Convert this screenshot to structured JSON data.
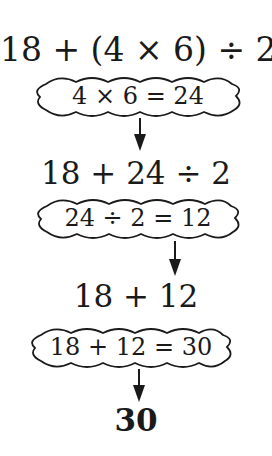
{
  "steps": {
    "expression_1": "18 + (4 × 6) ÷ 2",
    "cloud_1": "4 × 6 = 24",
    "expression_2": "18 + 24 ÷ 2",
    "cloud_2": "24 ÷ 2 = 12",
    "expression_3": "18 + 12",
    "cloud_3": "18 + 12 = 30",
    "result": "30"
  },
  "colors": {
    "ink": "#1a1a1a",
    "background": "#ffffff"
  }
}
